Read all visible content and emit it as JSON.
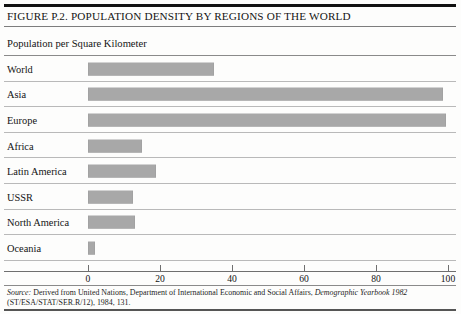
{
  "figure": {
    "title": "FIGURE P.2. POPULATION DENSITY BY REGIONS OF THE WORLD",
    "subtitle": "Population per Square Kilometer"
  },
  "source": {
    "label": "Source:",
    "line1_a": " Derived from United Nations, Department of International Economic and Social Affairs, ",
    "line1_italic": "Demographic Yearbook 1982",
    "line2": "(ST/ESA/STAT/SER.R/12), 1984, 131."
  },
  "colors": {
    "bar_fill": "#a8a8a8",
    "rule_dark": "#111111",
    "rule_light": "#b9b9b9",
    "text": "#141414",
    "background": "#fdfdfc"
  },
  "chart_data": {
    "type": "bar",
    "orientation": "horizontal",
    "title": "FIGURE P.2. POPULATION DENSITY BY REGIONS OF THE WORLD",
    "subtitle": "Population per Square Kilometer",
    "xlabel": "",
    "ylabel": "",
    "xlim": [
      0,
      100
    ],
    "grid": false,
    "legend": false,
    "xticks": [
      0,
      20,
      40,
      60,
      80,
      100
    ],
    "xtick_labels": [
      "0",
      "20",
      "40",
      "60",
      "80",
      "100"
    ],
    "categories": [
      "World",
      "Asia",
      "Europe",
      "Africa",
      "Latin America",
      "USSR",
      "North America",
      "Oceania"
    ],
    "values": [
      35,
      98.5,
      99.5,
      15,
      19,
      12.5,
      13,
      2
    ]
  }
}
